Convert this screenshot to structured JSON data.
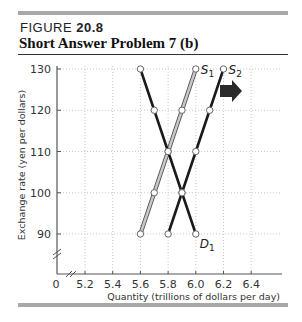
{
  "header": {
    "figure_prefix": "FIGURE",
    "figure_number": "20.8",
    "title": "Short Answer Problem 7 (b)"
  },
  "chart_data": {
    "type": "line",
    "title": "Short Answer Problem 7 (b)",
    "xlabel": "Quantity (trillions of dollars per day)",
    "ylabel": "Exchange rate (yen per dollars)",
    "x_ticks": [
      "0",
      "5.2",
      "5.4",
      "5.6",
      "5.8",
      "6.0",
      "6.2",
      "6.4"
    ],
    "y_ticks": [
      "90",
      "100",
      "110",
      "120",
      "130"
    ],
    "xlim": [
      5.1,
      6.55
    ],
    "ylim": [
      80,
      130
    ],
    "grid": true,
    "axis_breaks": [
      "x",
      "y"
    ],
    "series": [
      {
        "name": "S1",
        "color": "#b0b0b0",
        "x": [
          5.6,
          5.7,
          5.8,
          5.9,
          6.0
        ],
        "y": [
          90,
          100,
          110,
          120,
          130
        ]
      },
      {
        "name": "S2",
        "color": "#1a1a1a",
        "x": [
          5.8,
          5.9,
          6.0,
          6.1,
          6.2
        ],
        "y": [
          90,
          100,
          110,
          120,
          130
        ]
      },
      {
        "name": "D1",
        "color": "#1a1a1a",
        "x": [
          5.6,
          5.7,
          5.8,
          5.9,
          6.0
        ],
        "y": [
          130,
          120,
          110,
          100,
          90
        ]
      }
    ],
    "annotations": [
      {
        "type": "arrow",
        "direction": "right",
        "meaning": "supply shifts from S1 to S2",
        "near": [
          6.05,
          125
        ]
      }
    ]
  }
}
